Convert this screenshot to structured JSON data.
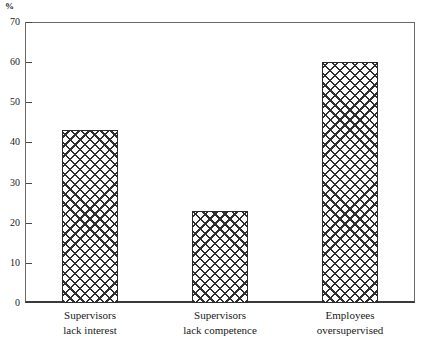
{
  "chart_data": {
    "type": "bar",
    "title": "",
    "subtitle": "",
    "xlabel": "",
    "ylabel": "%",
    "unit_label": "%",
    "categories": [
      "Supervisors lack interest",
      "Supervisors lack competence",
      "Employees oversupervised"
    ],
    "category_lines": [
      [
        "Supervisors",
        "lack interest"
      ],
      [
        "Supervisors",
        "lack competence"
      ],
      [
        "Employees",
        "oversupervised"
      ]
    ],
    "values": [
      43,
      23,
      60
    ],
    "ylim": [
      0,
      70
    ],
    "ytick_values": [
      0,
      10,
      20,
      30,
      40,
      50,
      60,
      70
    ],
    "ytick_labels": [
      "0",
      "10",
      "20",
      "30",
      "40",
      "50",
      "60",
      "70"
    ],
    "grid": false,
    "legend": null,
    "legend_position": "none",
    "bar_fill": "crosshatch",
    "annotations": []
  },
  "colors": {
    "background": "#ffffff",
    "axis": "#4a4a4a",
    "baseline": "#3a3a3a",
    "text": "#1a1a1a",
    "bar_hatch": "#2f2f2f",
    "bar_outline": "#2b2b2b"
  }
}
